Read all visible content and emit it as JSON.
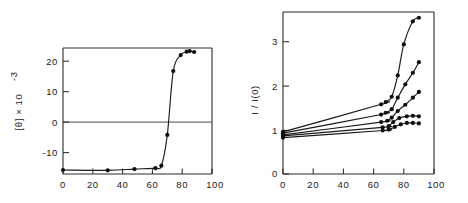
{
  "figure": {
    "background": "#ffffff",
    "ink": "#1a1a1a",
    "panels": [
      "left-panel",
      "right-panel"
    ]
  },
  "left_panel": {
    "name": "thermal-denaturation-plot",
    "ylabel": "[θ]  ×  10",
    "ylabel_exponent": "-3",
    "y_ticks": [
      "20",
      "10",
      "0",
      "-10"
    ],
    "x_ticks": [
      "0",
      "20",
      "40",
      "60",
      "80",
      "100"
    ]
  },
  "right_panel": {
    "name": "relative-intensity-plot",
    "ylabel": "I / I(0)",
    "y_ticks": [
      "3",
      "2",
      "1",
      "0"
    ],
    "x_ticks": [
      "0",
      "20",
      "40",
      "60",
      "80",
      "100"
    ]
  },
  "chart_data": [
    {
      "type": "line",
      "name": "left-panel",
      "title": "",
      "xlabel": "",
      "ylabel": "[θ] × 10^-3",
      "xlim": [
        0,
        100
      ],
      "ylim": [
        -15.5,
        25.5
      ],
      "xticks": [
        0,
        20,
        40,
        60,
        80,
        100
      ],
      "yticks": [
        -10,
        0,
        10,
        20
      ],
      "grid": false,
      "legend": "none",
      "zero_line": true,
      "series": [
        {
          "name": "ellipticity",
          "marker": "filled-circle",
          "x": [
            0,
            30,
            48,
            62,
            66,
            70,
            74,
            79,
            83,
            85,
            88
          ],
          "y": [
            -14.2,
            -14.3,
            -13.9,
            -13.6,
            -12.8,
            -2.8,
            18.0,
            23.2,
            24.3,
            24.5,
            24.2
          ]
        }
      ]
    },
    {
      "type": "line",
      "name": "right-panel",
      "title": "",
      "xlabel": "",
      "ylabel": "I / I(0)",
      "xlim": [
        0,
        100
      ],
      "ylim": [
        0,
        3.65
      ],
      "xticks": [
        0,
        20,
        40,
        60,
        80,
        100
      ],
      "yticks": [
        0,
        1,
        2,
        3
      ],
      "grid": false,
      "legend": "none",
      "series": [
        {
          "name": "curve-1",
          "marker": "filled-circle",
          "x": [
            0,
            65,
            68,
            72,
            76,
            80,
            86,
            90
          ],
          "y": [
            0.95,
            1.57,
            1.62,
            1.74,
            2.22,
            2.92,
            3.44,
            3.52
          ]
        },
        {
          "name": "curve-2",
          "marker": "filled-circle",
          "x": [
            0,
            65,
            68,
            72,
            76,
            81,
            86,
            90
          ],
          "y": [
            0.92,
            1.34,
            1.38,
            1.46,
            1.72,
            2.02,
            2.28,
            2.52
          ]
        },
        {
          "name": "curve-3",
          "marker": "filled-circle",
          "x": [
            0,
            65,
            69,
            72,
            76,
            81,
            86,
            90
          ],
          "y": [
            0.88,
            1.17,
            1.2,
            1.27,
            1.42,
            1.56,
            1.72,
            1.85
          ]
        },
        {
          "name": "curve-4",
          "marker": "filled-circle",
          "x": [
            0,
            66,
            70,
            73,
            77,
            82,
            86,
            90
          ],
          "y": [
            0.86,
            1.05,
            1.08,
            1.17,
            1.26,
            1.3,
            1.31,
            1.3
          ]
        },
        {
          "name": "curve-5",
          "marker": "filled-circle",
          "x": [
            0,
            66,
            70,
            74,
            78,
            82,
            86,
            90
          ],
          "y": [
            0.82,
            0.98,
            1.0,
            1.06,
            1.12,
            1.15,
            1.15,
            1.14
          ]
        }
      ]
    }
  ]
}
